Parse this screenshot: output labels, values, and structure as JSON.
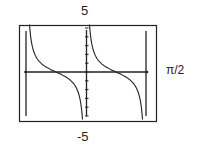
{
  "chart_data": {
    "type": "line",
    "title": "",
    "function_description": "cotangent-shaped decreasing branches with vertical asymptotes",
    "window": {
      "ymax_label": "5",
      "ymin_label": "-5",
      "xscale_label": "π/2",
      "ylim": [
        -5,
        5
      ],
      "xlim": [
        -3.1416,
        3.1416
      ]
    },
    "asymptotes_x": [
      -3.1416,
      0,
      3.1416
    ],
    "zeros_x": [
      -1.5708,
      1.5708
    ],
    "series": [
      {
        "name": "branch-left",
        "x": [
          -3.0,
          -2.6,
          -2.2,
          -1.9,
          -1.5708,
          -1.2,
          -0.9,
          -0.5,
          -0.2
        ],
        "y": [
          7.0,
          1.7,
          0.73,
          0.34,
          0,
          -0.39,
          -0.79,
          -1.83,
          -4.93
        ]
      },
      {
        "name": "branch-right",
        "x": [
          0.2,
          0.5,
          0.9,
          1.2,
          1.5708,
          1.9,
          2.2,
          2.6,
          3.0
        ],
        "y": [
          4.93,
          1.83,
          0.79,
          0.39,
          0,
          -0.34,
          -0.73,
          -1.7,
          -7.0
        ]
      }
    ],
    "grid": false,
    "axes": true
  },
  "labels": {
    "top": "5",
    "right": "π/2",
    "bottom": "-5"
  }
}
